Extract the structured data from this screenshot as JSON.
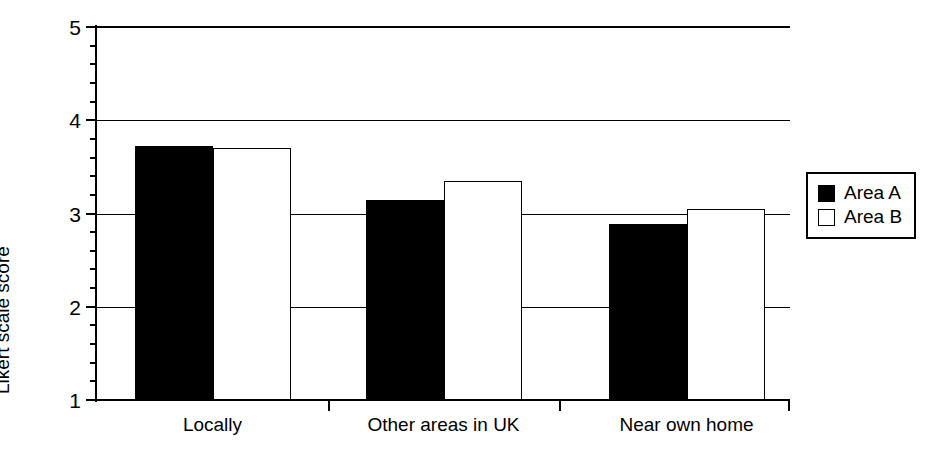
{
  "chart_data": {
    "type": "bar",
    "title": "",
    "xlabel": "",
    "ylabel": "Likert scale score",
    "categories": [
      "Locally",
      "Other areas in UK",
      "Near own home"
    ],
    "series": [
      {
        "name": "Area A",
        "color": "#000000",
        "fill": "solid",
        "values": [
          3.72,
          3.15,
          2.89
        ]
      },
      {
        "name": "Area B",
        "color": "#ffffff",
        "fill": "hollow",
        "values": [
          3.7,
          3.35,
          3.05
        ]
      }
    ],
    "ylim": [
      1,
      5
    ],
    "ytick_labels": [
      "1",
      "2",
      "3",
      "4",
      "5"
    ],
    "ytick_values": [
      1,
      2,
      3,
      4,
      5
    ],
    "yminor_step": 0.2,
    "grid": "horizontal",
    "legend_position": "right",
    "legend_entries": [
      "Area A",
      "Area B"
    ]
  },
  "legend": {
    "items": [
      {
        "label": "Area A",
        "swatch": "filled-square-icon"
      },
      {
        "label": "Area B",
        "swatch": "hollow-square-icon"
      }
    ]
  },
  "axes": {
    "y_title": "Likert scale score"
  }
}
